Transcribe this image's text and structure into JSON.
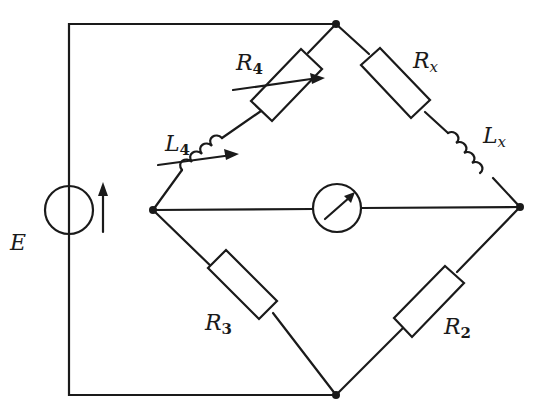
{
  "diagram": {
    "type": "AC bridge circuit (Maxwell inductance bridge)",
    "source": {
      "label": "E",
      "symbol": "voltage-source"
    },
    "components": [
      {
        "id": "R4",
        "label": "R",
        "sub": "4",
        "type": "variable-resistor",
        "branch": "left-top"
      },
      {
        "id": "L4",
        "label": "L",
        "sub": "4",
        "type": "variable-inductor",
        "branch": "left-top"
      },
      {
        "id": "Rx",
        "label": "R",
        "sub": "x",
        "type": "resistor",
        "branch": "right-top"
      },
      {
        "id": "Lx",
        "label": "L",
        "sub": "x",
        "type": "inductor",
        "branch": "right-top"
      },
      {
        "id": "R3",
        "label": "R",
        "sub": "3",
        "type": "resistor",
        "branch": "left-bottom"
      },
      {
        "id": "R2",
        "label": "R",
        "sub": "2",
        "type": "resistor",
        "branch": "right-bottom"
      },
      {
        "id": "G",
        "type": "galvanometer",
        "branch": "diagonal"
      }
    ],
    "nodes": [
      "top",
      "left",
      "right",
      "bottom"
    ],
    "colors": {
      "line": "#1a1a1a",
      "background": "#ffffff"
    }
  }
}
